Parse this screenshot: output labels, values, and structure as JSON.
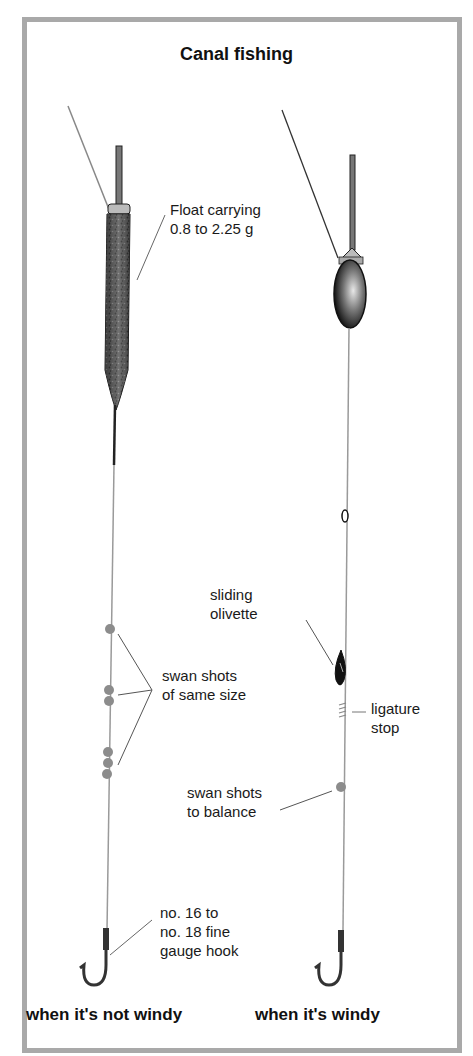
{
  "title": "Canal fishing",
  "rigs": [
    {
      "caption": "when it's not windy",
      "float_type": "long slim float",
      "labels": {
        "float": "Float carrying\n0.8 to 2.25 g",
        "shots": "swan shots\nof same size",
        "hook": "no. 16 to\nno. 18 fine\ngauge hook"
      }
    },
    {
      "caption": "when it's windy",
      "float_type": "bodied float",
      "labels": {
        "olivette": "sliding\nolivette",
        "ligature": "ligature\nstop",
        "shots": "swan shots\nto balance"
      }
    }
  ],
  "colors": {
    "frame": "#a9a9a9",
    "line": "#9a9a9a",
    "float_dark": "#2a2a2a",
    "shot": "#8c8c8c"
  }
}
